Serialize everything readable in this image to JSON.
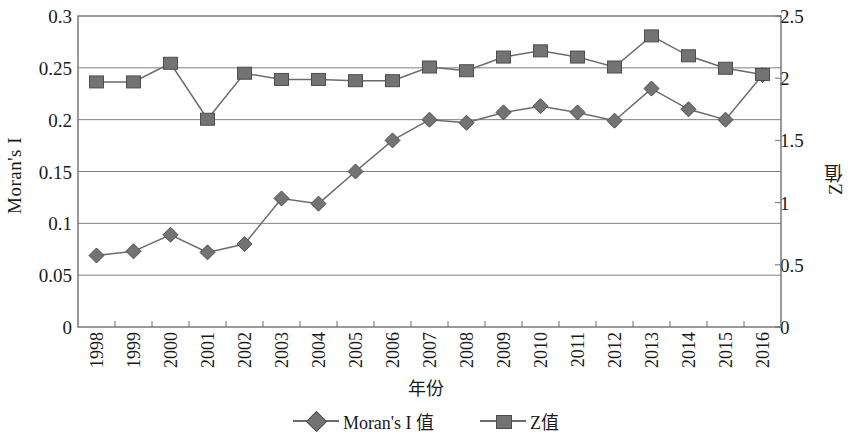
{
  "chart_data": {
    "type": "line",
    "title": "",
    "xlabel": "年份",
    "ylabel": "Moran's I",
    "y2label": "Z值",
    "grid": true,
    "legend_position": "bottom",
    "categories": [
      "1998",
      "1999",
      "2000",
      "2001",
      "2002",
      "2003",
      "2004",
      "2005",
      "2006",
      "2007",
      "2008",
      "2009",
      "2010",
      "2011",
      "2012",
      "2013",
      "2014",
      "2015",
      "2016"
    ],
    "ylim": [
      0,
      0.3
    ],
    "yticks": [
      "0",
      "0.05",
      "0.1",
      "0.15",
      "0.2",
      "0.25",
      "0.3"
    ],
    "ytick_values": [
      0,
      0.05,
      0.1,
      0.15,
      0.2,
      0.25,
      0.3
    ],
    "y2lim": [
      0,
      2.5
    ],
    "y2ticks": [
      "0",
      "0.5",
      "1",
      "1.5",
      "2",
      "2.5"
    ],
    "y2tick_values": [
      0,
      0.5,
      1,
      1.5,
      2,
      2.5
    ],
    "series": [
      {
        "name": "Moran's I 值",
        "axis": "left",
        "marker": "diamond",
        "color": "#737373",
        "line_color": "#6b6b6b",
        "values": [
          0.069,
          0.073,
          0.089,
          0.072,
          0.08,
          0.124,
          0.119,
          0.15,
          0.18,
          0.2,
          0.197,
          0.207,
          0.213,
          0.207,
          0.199,
          0.23,
          0.21,
          0.2,
          0.243
        ]
      },
      {
        "name": "Z值",
        "axis": "right",
        "marker": "square",
        "color": "#737373",
        "line_color": "#6b6b6b",
        "values": [
          1.97,
          1.97,
          2.12,
          1.67,
          2.04,
          1.99,
          1.99,
          1.98,
          1.98,
          2.09,
          2.06,
          2.17,
          2.22,
          2.17,
          2.09,
          2.34,
          2.18,
          2.08,
          2.03
        ]
      }
    ]
  },
  "legend": {
    "items": [
      {
        "label": "Moran's I 值",
        "marker": "diamond"
      },
      {
        "label": "Z值",
        "marker": "square"
      }
    ]
  },
  "colors": {
    "marker_fill": "#737373",
    "marker_stroke": "#4d4d4d",
    "line": "#6b6b6b",
    "grid": "#808080",
    "frame": "#6f6f6f",
    "text": "#1a1a1a"
  }
}
